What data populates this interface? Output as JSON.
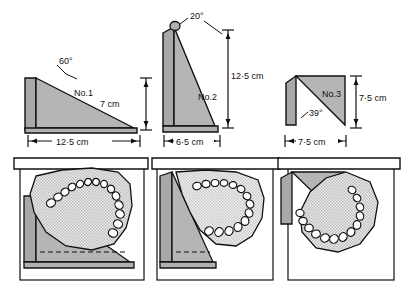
{
  "figure": {
    "type": "technical-line-drawing",
    "colors": {
      "line": "#111111",
      "wedge_fill": "#b5b5b5",
      "wedge_side_fill": "#a8a8a8",
      "cast_fill": "#e8e8e8",
      "background": "#ffffff",
      "frame_fill": "#ffffff"
    }
  },
  "wedges": [
    {
      "id": "no1",
      "name_label": "No.1",
      "angle_label": "60°",
      "height_label": "7 cm",
      "base_label": "12·5 cm",
      "shape": "right-triangle, vertical left edge, hypotenuse sloping down to the right"
    },
    {
      "id": "no2",
      "name_label": "No.2",
      "angle_label": "20°",
      "height_label": "12·5 cm",
      "base_label": "6·5 cm",
      "shape": "tall narrow right-triangle, vertical left edge, hypotenuse sloping down to the right"
    },
    {
      "id": "no3",
      "name_label": "No.3",
      "angle_label": "39°",
      "height_label": "7·5 cm",
      "base_label": "7·5 cm",
      "shape": "right-triangle, horizontal top edge, vertical right edge, hypotenuse from lower-left to upper-right"
    }
  ],
  "lower_row": {
    "caption": "Each wedge shown in use, supporting a dental cast under a horizontal bar",
    "panels": [
      {
        "id": "panel-no1",
        "cast": "maxillary dental cast tilted, arch opening toward lower-right"
      },
      {
        "id": "panel-no2",
        "cast": "dental cast steeply tilted, arch opening toward lower-left"
      },
      {
        "id": "panel-no3",
        "cast": "dental cast tilted, arch opening toward upper-left"
      }
    ]
  }
}
